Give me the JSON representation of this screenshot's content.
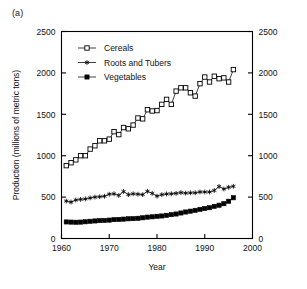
{
  "figure": {
    "panel_label": "(a)"
  },
  "chart_data": {
    "type": "line",
    "title": "",
    "xlabel": "Year",
    "ylabel": "Production (millions of metric tons)",
    "ylabel_right": "",
    "xlim": [
      1960,
      2000
    ],
    "ylim": [
      0,
      2500
    ],
    "xticks": [
      1960,
      1970,
      1980,
      1990,
      2000
    ],
    "yticks": [
      0,
      500,
      1000,
      1500,
      2000,
      2500
    ],
    "yticks_right": [
      0,
      500,
      1000,
      1500,
      2000,
      2500
    ],
    "grid": false,
    "legend_position": "upper left inside",
    "x": [
      1961,
      1962,
      1963,
      1964,
      1965,
      1966,
      1967,
      1968,
      1969,
      1970,
      1971,
      1972,
      1973,
      1974,
      1975,
      1976,
      1977,
      1978,
      1979,
      1980,
      1981,
      1982,
      1983,
      1984,
      1985,
      1986,
      1987,
      1988,
      1989,
      1990,
      1991,
      1992,
      1993,
      1994,
      1995,
      1996
    ],
    "series": [
      {
        "name": "Cereals",
        "marker": "open-square",
        "color": "#000000",
        "values": [
          880,
          915,
          950,
          1000,
          1000,
          1080,
          1120,
          1180,
          1180,
          1200,
          1290,
          1255,
          1340,
          1325,
          1370,
          1455,
          1445,
          1555,
          1540,
          1545,
          1620,
          1680,
          1620,
          1780,
          1820,
          1820,
          1760,
          1720,
          1870,
          1950,
          1890,
          1960,
          1930,
          1940,
          1890,
          2040
        ]
      },
      {
        "name": "Roots and Tubers",
        "marker": "star",
        "color": "#000000",
        "values": [
          452,
          440,
          465,
          472,
          478,
          490,
          500,
          505,
          510,
          535,
          540,
          520,
          568,
          530,
          540,
          535,
          530,
          570,
          545,
          512,
          530,
          538,
          540,
          545,
          555,
          548,
          552,
          552,
          562,
          562,
          562,
          580,
          628,
          598,
          618,
          630
        ]
      },
      {
        "name": "Vegetables",
        "marker": "filled-square",
        "color": "#000000",
        "values": [
          200,
          198,
          196,
          198,
          202,
          208,
          212,
          216,
          218,
          222,
          228,
          230,
          234,
          238,
          240,
          244,
          250,
          258,
          262,
          268,
          272,
          280,
          288,
          296,
          308,
          320,
          330,
          340,
          352,
          362,
          372,
          388,
          402,
          420,
          450,
          492
        ]
      }
    ]
  },
  "legend": {
    "items": [
      {
        "label": "Cereals",
        "marker": "open-square"
      },
      {
        "label": "Roots and Tubers",
        "marker": "star"
      },
      {
        "label": "Vegetables",
        "marker": "filled-square"
      }
    ]
  }
}
